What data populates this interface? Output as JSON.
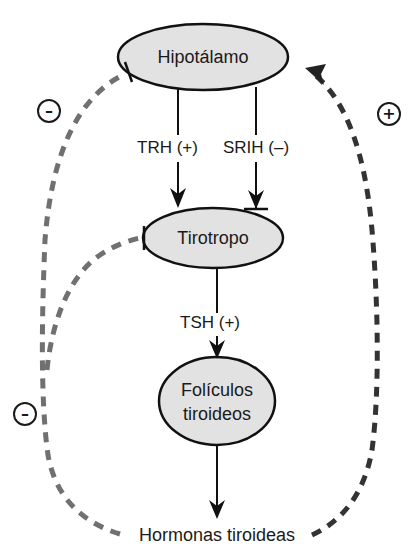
{
  "nodes": {
    "hypothalamus": "Hipotálamo",
    "thyrotrope": "Tirotropo",
    "follicles_line1": "Folículos",
    "follicles_line2": "tiroideos",
    "hormones": "Hormonas tiroideas"
  },
  "edges": {
    "trh": "TRH (+)",
    "srih": "SRIH (–)",
    "tsh": "TSH (+)"
  },
  "feedback": {
    "negative_hypothalamus_sign": "–",
    "negative_thyrotrope_sign": "–",
    "positive_hypothalamus_sign": "+"
  },
  "colors": {
    "node_fill": "#e2e2e2",
    "stroke": "#111111",
    "negative_dash": "#707070",
    "positive_dash": "#333333"
  }
}
